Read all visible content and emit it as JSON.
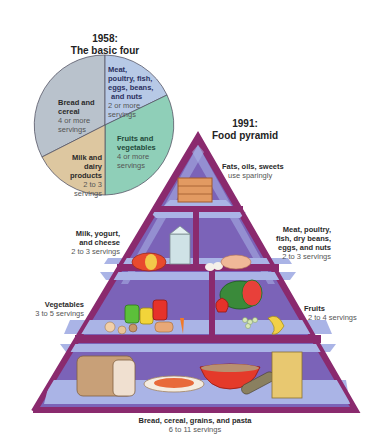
{
  "basic_four": {
    "title_year": "1958:",
    "title": "The basic four",
    "segments": [
      {
        "name": "Bread and cereal",
        "label_lines": [
          "Bread and",
          "cereal"
        ],
        "servings_lines": [
          "4 or more",
          "servings"
        ],
        "color": "#b9c2cc"
      },
      {
        "name": "Meat, poultry, fish, eggs, beans, and nuts",
        "label_lines": [
          "Meat,",
          "poultry, fish,",
          "eggs, beans,",
          "and nuts"
        ],
        "servings_lines": [
          "2 or more",
          "servings"
        ],
        "color": "#b7c9e6"
      },
      {
        "name": "Fruits and vegetables",
        "label_lines": [
          "Fruits and",
          "vegetables"
        ],
        "servings_lines": [
          "4 or more",
          "servings"
        ],
        "color": "#8fcfb8"
      },
      {
        "name": "Milk and dairy products",
        "label_lines": [
          "Milk and",
          "dairy",
          "products"
        ],
        "servings_lines": [
          "2 to 3",
          "servings"
        ],
        "color": "#ddc7a0"
      }
    ]
  },
  "food_pyramid": {
    "title_year": "1991:",
    "title": "Food pyramid",
    "colors": {
      "frame": "#8a2a6e",
      "inner": "#7b63b8",
      "shelf": "#aab4e6"
    },
    "tiers": [
      {
        "name": "Fats, oils, sweets",
        "servings": "use sparingly"
      },
      {
        "name_lines": [
          "Milk, yogurt,",
          "and cheese"
        ],
        "servings": "2 to 3 servings"
      },
      {
        "name_lines": [
          "Meat, poultry,",
          "fish, dry beans,",
          "eggs, and nuts"
        ],
        "servings": "2 to 3 servings"
      },
      {
        "name": "Vegetables",
        "servings": "3 to 5 servings"
      },
      {
        "name": "Fruits",
        "servings": "2 to 4 servings"
      },
      {
        "name": "Bread, cereal, grains, and pasta",
        "servings": "6 to 11 servings"
      }
    ]
  }
}
